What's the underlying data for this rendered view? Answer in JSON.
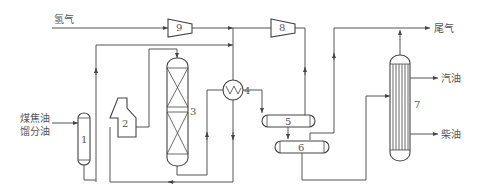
{
  "diagram": {
    "title": "",
    "streams": {
      "hydrogen_in": "氢气",
      "feed_line1": "煤焦油",
      "feed_line2": "馏分油",
      "tail_gas": "尾气",
      "gasoline": "汽油",
      "diesel": "柴油"
    },
    "equipment": [
      {
        "id": "1",
        "label": "1",
        "type": "feed vessel"
      },
      {
        "id": "2",
        "label": "2",
        "type": "heating furnace"
      },
      {
        "id": "3",
        "label": "3",
        "type": "reactor (two packed beds)"
      },
      {
        "id": "4",
        "label": "4",
        "type": "heat exchanger"
      },
      {
        "id": "5",
        "label": "5",
        "type": "high-pressure separator"
      },
      {
        "id": "6",
        "label": "6",
        "type": "low-pressure separator"
      },
      {
        "id": "7",
        "label": "7",
        "type": "fractionation column"
      },
      {
        "id": "8",
        "label": "8",
        "type": "recycle compressor"
      },
      {
        "id": "9",
        "label": "9",
        "type": "make-up hydrogen compressor"
      }
    ]
  }
}
